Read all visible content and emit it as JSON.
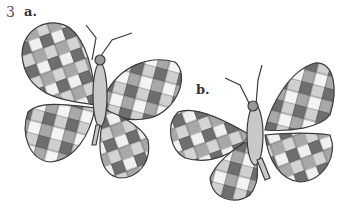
{
  "exercise": {
    "number": "3"
  },
  "figures": [
    {
      "label": "a.",
      "description": "butterfly with checkered wings"
    },
    {
      "label": "b.",
      "description": "butterfly with checkered wings"
    }
  ],
  "colors": {
    "dark": "#6e6e6e",
    "mid": "#a8a8a8",
    "light": "#d4d4d4",
    "white": "#f4f4f4",
    "outline": "#3a3a3a",
    "body": "#c8c8c8"
  }
}
